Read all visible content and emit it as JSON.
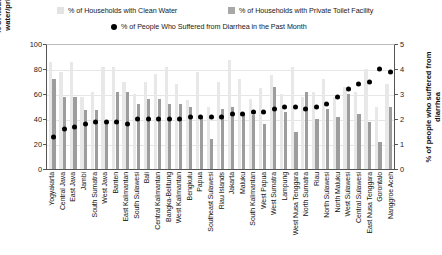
{
  "legend": {
    "water": "% of Households with Clean Water",
    "toilet": "% of Households with Private Toilet Facility",
    "diarrhea": "% of People Who Suffered from Diarrhea in the Past Month"
  },
  "axes": {
    "left_title": "% of households with clean water/private toilet facility",
    "right_title": "% of people who suffered from diarrhea",
    "left_ticks": [
      "100",
      "80",
      "60",
      "40",
      "20",
      "0"
    ],
    "right_ticks": [
      "5",
      "4",
      "3",
      "2",
      "1",
      "0"
    ]
  },
  "colors": {
    "water": "#e8e8e8",
    "toilet": "#9d9d9d",
    "diarrhea": "#000000",
    "axis": "#555555",
    "grid": "#e6e6e6"
  },
  "chart_data": {
    "type": "bar",
    "title": "",
    "xlabel": "",
    "ylabel": "% of households with clean water/private toilet facility",
    "y2label": "% of people who suffered from diarrhea",
    "ylim": [
      0,
      100
    ],
    "y2lim": [
      0,
      5
    ],
    "grid": true,
    "legend_position": "top",
    "categories": [
      "Yogyakarta",
      "Central Java",
      "East Java",
      "Jambi",
      "South Sumatra",
      "West Java",
      "Banten",
      "East Kalimantan",
      "South Sulawesi",
      "Bali",
      "Central Kalimantan",
      "Bangka-Belitung",
      "West Kalimantan",
      "Bengkulu",
      "Papua",
      "Southeast Sulawesi",
      "Riau Islands",
      "Jakarta",
      "Maluku",
      "South Kalimantan",
      "West Papua",
      "West Sumatra",
      "Lampung",
      "West Nusa Tenggara",
      "North Sumatra",
      "Riau",
      "North Sulawesi",
      "North Maluku",
      "West Sulawesi",
      "Central Sulawesi",
      "East Nusa Tenggara",
      "Gorontalo",
      "Nanggroe Aceh"
    ],
    "series": [
      {
        "name": "% of Households with Clean Water",
        "axis": "left",
        "color": "#e8e8e8",
        "values": [
          86,
          78,
          86,
          58,
          62,
          82,
          82,
          70,
          60,
          70,
          76,
          82,
          68,
          55,
          78,
          50,
          70,
          87,
          72,
          56,
          65,
          75,
          60,
          82,
          58,
          62,
          72,
          58,
          66,
          62,
          80,
          50,
          68
        ]
      },
      {
        "name": "% of Households with Private Toilet Facility",
        "axis": "left",
        "color": "#9d9d9d",
        "values": [
          72,
          58,
          58,
          47,
          47,
          38,
          62,
          62,
          52,
          56,
          56,
          52,
          52,
          50,
          42,
          24,
          48,
          50,
          45,
          43,
          36,
          66,
          46,
          30,
          62,
          40,
          48,
          42,
          60,
          44,
          38,
          22,
          50
        ]
      }
    ],
    "dot_series": {
      "name": "% of People Who Suffered from Diarrhea in the Past Month",
      "axis": "right",
      "color": "#000000",
      "values": [
        1.3,
        1.6,
        1.7,
        1.8,
        1.9,
        1.9,
        1.9,
        1.8,
        2.0,
        2.0,
        2.0,
        2.0,
        2.0,
        2.1,
        2.1,
        2.1,
        2.1,
        2.2,
        2.2,
        2.3,
        2.3,
        2.4,
        2.5,
        2.5,
        2.4,
        2.5,
        2.6,
        2.9,
        3.2,
        3.4,
        3.5,
        4.0,
        3.9
      ]
    }
  }
}
